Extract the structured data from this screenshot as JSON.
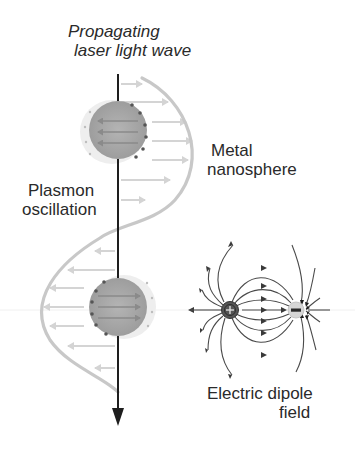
{
  "diagram": {
    "title_line1": "Propagating",
    "title_line2": "laser light wave",
    "label_metal_line1": "Metal",
    "label_metal_line2": "nanosphere",
    "label_plasmon_line1": "Plasmon",
    "label_plasmon_line2": "oscillation",
    "label_dipole_line1": "Electric dipole",
    "label_dipole_line2": "field",
    "positive_charge_symbol": "+",
    "negative_charge_symbol": "−",
    "colors": {
      "axis": "#1e1e1e",
      "wave": "#c8c8c8",
      "field_arrows": "#d0d0d0",
      "sphere": "#a9a9a9",
      "sphere_halo": "#e6e6e6",
      "dipole_positive": "#555555",
      "dipole_negative": "#cfcfcf",
      "field_lines": "#444444",
      "text": "#2a2a2a"
    }
  }
}
